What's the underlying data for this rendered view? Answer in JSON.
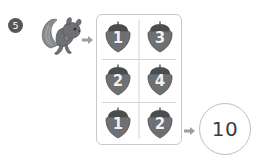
{
  "worksheet": {
    "question_number": "5",
    "animal_icon": "squirrel-icon",
    "arrow_icon": "right-arrow-icon",
    "grid": {
      "columns": 2,
      "rows": 3,
      "cells": [
        {
          "icon": "acorn-icon",
          "value": "1"
        },
        {
          "icon": "acorn-icon",
          "value": "3"
        },
        {
          "icon": "acorn-icon",
          "value": "2"
        },
        {
          "icon": "acorn-icon",
          "value": "4"
        },
        {
          "icon": "acorn-icon",
          "value": "1"
        },
        {
          "icon": "acorn-icon",
          "value": "2"
        }
      ]
    },
    "answer": "10",
    "colors": {
      "badge_fill": "#555759",
      "grid_border": "#c9cacb",
      "divider": "#d3d4d5",
      "acorn_body": "#6e7073",
      "acorn_cap": "#4a4c4e",
      "answer_border": "#bfc0c1",
      "answer_text": "#3b3d3f",
      "squirrel_body": "#6e7073",
      "arrow": "#9b9d9f"
    }
  }
}
